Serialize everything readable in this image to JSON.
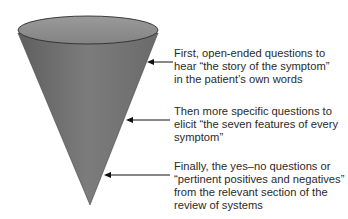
{
  "diagram": {
    "type": "funnel-cone",
    "cone": {
      "fill_color": "#7a7a7a",
      "top_color": "#8a8a8a",
      "edge_color": "#333333"
    },
    "annotations": [
      {
        "lines": [
          "First, open-ended questions to",
          "hear “the story of the symptom”",
          "in the patient’s own words"
        ]
      },
      {
        "lines": [
          "Then more specific questions to",
          "elicit “the seven features of every",
          "symptom”"
        ]
      },
      {
        "lines": [
          "Finally, the yes–no questions or",
          "“pertinent positives and negatives”",
          "from the relevant section of the",
          "review of systems"
        ]
      }
    ]
  }
}
